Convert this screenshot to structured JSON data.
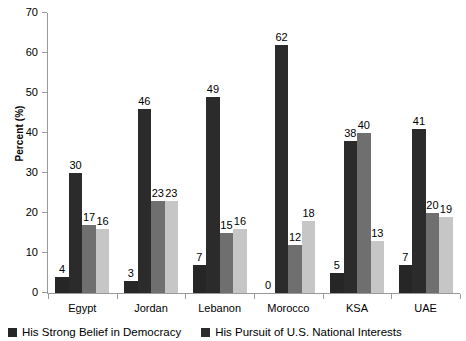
{
  "chart_data": {
    "type": "bar",
    "title": "",
    "xlabel": "",
    "ylabel": "Percent (%)",
    "ylim": [
      0,
      70
    ],
    "yticks": [
      0,
      10,
      20,
      30,
      40,
      50,
      60,
      70
    ],
    "ytick_labels": [
      "0",
      "10",
      "20",
      "30",
      "40",
      "50",
      "60",
      "70"
    ],
    "grid": false,
    "legend_position": "bottom-left",
    "categories": [
      "Egypt",
      "Jordan",
      "Lebanon",
      "Morocco",
      "KSA",
      "UAE"
    ],
    "series": [
      {
        "name": "His Strong Belief in Democracy",
        "color": "#262626",
        "values": [
          4,
          3,
          7,
          0,
          5,
          7
        ],
        "labels": [
          "4",
          "3",
          "7",
          "0",
          "5",
          "7"
        ]
      },
      {
        "name": "His Pursuit of U.S. National Interests",
        "color": "#2b2b2b",
        "values": [
          30,
          46,
          49,
          62,
          38,
          41
        ],
        "labels": [
          "30",
          "46",
          "49",
          "62",
          "38",
          "41"
        ]
      },
      {
        "name": "series-3",
        "color": "#6f6f6f",
        "values": [
          17,
          23,
          15,
          12,
          40,
          20
        ],
        "labels": [
          "17",
          "23",
          "15",
          "12",
          "40",
          "20"
        ]
      },
      {
        "name": "series-4",
        "color": "#c6c6c6",
        "values": [
          16,
          23,
          16,
          18,
          13,
          19
        ],
        "labels": [
          "16",
          "23",
          "16",
          "18",
          "13",
          "19"
        ]
      }
    ],
    "legend": [
      {
        "label": "His Strong Belief in Democracy",
        "color": "#262626"
      },
      {
        "label": "His Pursuit of U.S. National Interests",
        "color": "#2b2b2b"
      }
    ]
  }
}
